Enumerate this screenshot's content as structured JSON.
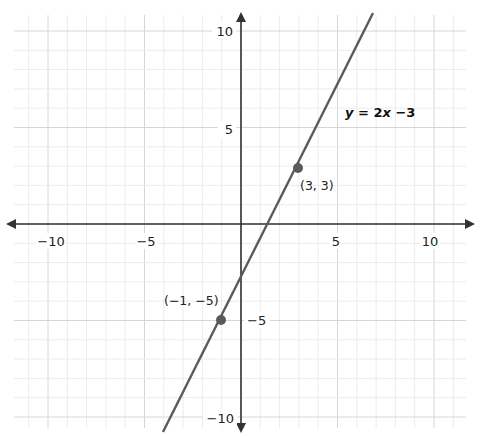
{
  "chart_data": {
    "type": "line",
    "title": "",
    "xlabel": "",
    "ylabel": "",
    "xlim": [
      -11.7,
      11.7
    ],
    "ylim": [
      -10.6,
      10.8
    ],
    "grid": true,
    "grid_minor_step": 1,
    "grid_major_step": 5,
    "x_ticks": [
      -10,
      -5,
      5,
      10
    ],
    "x_tick_labels": [
      "−10",
      "−5",
      "5",
      "10"
    ],
    "y_ticks": [
      10,
      5,
      -5,
      -10
    ],
    "y_tick_labels": [
      "10",
      "5",
      "−5",
      "−10"
    ],
    "series": [
      {
        "name": "y = 2x −3",
        "slope": 2,
        "intercept": -3,
        "x": [
          -3.9,
          6.9
        ],
        "y": [
          -10.8,
          10.8
        ],
        "color": "#5a5a5a"
      }
    ],
    "points": [
      {
        "x": 3,
        "y": 3,
        "label": "(3, 3)"
      },
      {
        "x": -1,
        "y": -5,
        "label": "(−1, −5)"
      }
    ],
    "annotations": [
      {
        "text_var": "y",
        "text_rest": " = 2",
        "text_var2": "x",
        "text_tail": " −3"
      }
    ],
    "colors": {
      "axis": "#333333",
      "line": "#5a5a5a",
      "grid_minor": "#ececec",
      "grid_major": "#d6d6d6"
    }
  },
  "labels": {
    "equation_y": "y",
    "equation_mid": " = 2",
    "equation_x": "x",
    "equation_tail": " −3",
    "point_a": "(3, 3)",
    "point_b": "(−1, −5)",
    "x_tick_m10": "−10",
    "x_tick_m5": "−5",
    "x_tick_5": "5",
    "x_tick_10": "10",
    "y_tick_10": "10",
    "y_tick_5": "5",
    "y_tick_m5": "−5",
    "y_tick_m10": "−10"
  }
}
